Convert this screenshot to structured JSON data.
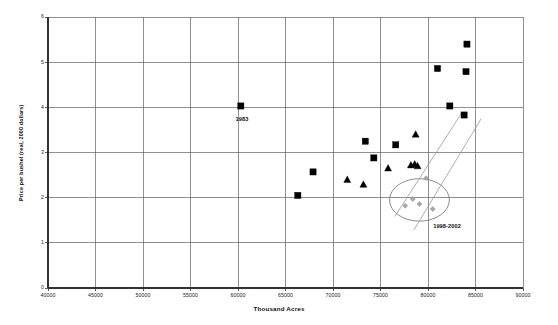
{
  "chart_data": {
    "type": "scatter",
    "title": "",
    "xlabel": "Thousand Acres",
    "ylabel": "Price per bushel (real, 2000 dollars)",
    "xlim": [
      40000,
      90000
    ],
    "ylim": [
      0,
      6
    ],
    "xticks": [
      "40000",
      "45000",
      "50000",
      "55000",
      "60000",
      "65000",
      "70000",
      "75000",
      "80000",
      "85000",
      "90000"
    ],
    "yticks": [
      "0",
      "1",
      "2",
      "3",
      "4",
      "5",
      "6"
    ],
    "grid": true,
    "legend": "none",
    "series": [
      {
        "name": "early-years-squares",
        "marker": "square",
        "color": "#000000",
        "points": [
          {
            "x": 60300,
            "y": 4.03
          },
          {
            "x": 66300,
            "y": 2.05
          },
          {
            "x": 67900,
            "y": 2.57
          },
          {
            "x": 73400,
            "y": 3.25
          },
          {
            "x": 74300,
            "y": 2.88
          },
          {
            "x": 76600,
            "y": 3.17
          },
          {
            "x": 81000,
            "y": 4.86
          },
          {
            "x": 82300,
            "y": 4.03
          },
          {
            "x": 83800,
            "y": 3.83
          },
          {
            "x": 84100,
            "y": 5.4
          },
          {
            "x": 84000,
            "y": 4.79
          }
        ]
      },
      {
        "name": "mid-years-triangles",
        "marker": "triangle",
        "color": "#000000",
        "points": [
          {
            "x": 71500,
            "y": 2.4
          },
          {
            "x": 73200,
            "y": 2.29
          },
          {
            "x": 75800,
            "y": 2.65
          },
          {
            "x": 78700,
            "y": 3.4
          },
          {
            "x": 78200,
            "y": 2.72
          },
          {
            "x": 78600,
            "y": 2.74
          },
          {
            "x": 78900,
            "y": 2.7
          }
        ]
      },
      {
        "name": "recent-years-diamonds",
        "marker": "diamond",
        "color": "#a8a8a8",
        "points": [
          {
            "x": 77600,
            "y": 1.82
          },
          {
            "x": 78400,
            "y": 1.97
          },
          {
            "x": 79100,
            "y": 1.86
          },
          {
            "x": 79800,
            "y": 2.43
          },
          {
            "x": 80500,
            "y": 1.75
          }
        ]
      }
    ],
    "annotations": [
      {
        "name": "point-label-1983",
        "text": "1983",
        "x": 60800,
        "y": 3.72
      },
      {
        "name": "cluster-label-1998-2002",
        "text": "1998-2002",
        "x": 81600,
        "y": 1.36
      }
    ],
    "shapes": [
      {
        "name": "cluster-ellipse",
        "type": "ellipse",
        "cx": 79100,
        "cy": 1.95,
        "rx": 3150,
        "ry": 0.47,
        "color": "#6e6e6e"
      },
      {
        "name": "trend-line-1",
        "type": "line",
        "x1": 76500,
        "y1": 1.58,
        "x2": 83500,
        "y2": 3.86,
        "color": "#9a9a9a"
      },
      {
        "name": "trend-line-2",
        "type": "line",
        "x1": 78500,
        "y1": 1.28,
        "x2": 85600,
        "y2": 3.75,
        "color": "#9a9a9a"
      }
    ]
  }
}
